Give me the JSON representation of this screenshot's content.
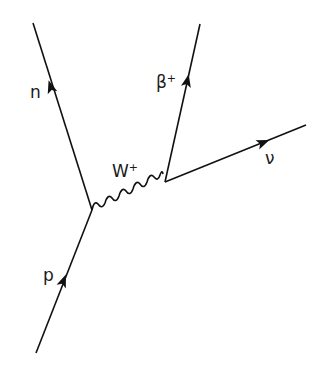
{
  "diagram": {
    "type": "feynman",
    "colors": {
      "line": "#111111",
      "background": "#ffffff",
      "text": "#1a1a1a"
    },
    "vertices": [
      {
        "id": "v1",
        "x": 92,
        "y": 210
      },
      {
        "id": "v2",
        "x": 165,
        "y": 182
      }
    ],
    "particles": {
      "p": {
        "label": "p",
        "kind": "fermion-in",
        "from": [
          36,
          353
        ],
        "to": [
          92,
          210
        ]
      },
      "n": {
        "label": "n",
        "kind": "fermion-out",
        "from": [
          92,
          210
        ],
        "to": [
          33,
          23
        ]
      },
      "w": {
        "label_base": "W",
        "label_sup": "+",
        "kind": "boson",
        "from": [
          92,
          210
        ],
        "to": [
          165,
          182
        ]
      },
      "beta": {
        "label_base": "β",
        "label_sup": "+",
        "kind": "fermion-out",
        "from": [
          165,
          182
        ],
        "to": [
          200,
          24
        ]
      },
      "nu": {
        "label": "ν",
        "kind": "fermion-out",
        "from": [
          165,
          182
        ],
        "to": [
          306,
          125
        ]
      }
    }
  }
}
